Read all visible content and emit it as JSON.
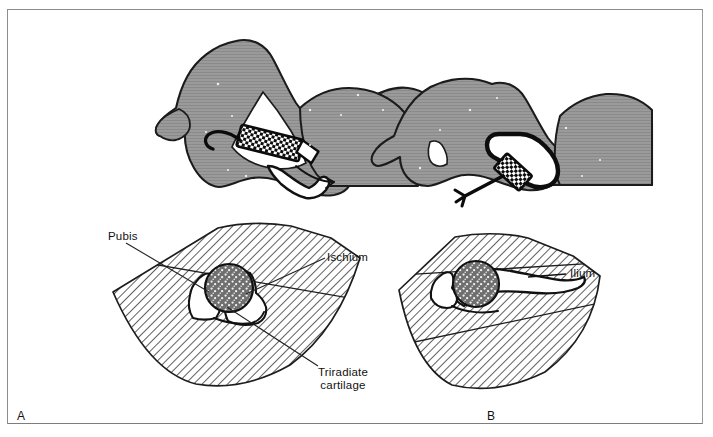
{
  "figure": {
    "panels": [
      {
        "id": "A",
        "letter": "A",
        "scan_plane": "coronal-anterior",
        "labels": [
          {
            "name": "pubis",
            "text": "Pubis"
          },
          {
            "name": "ischium",
            "text": "Ischium"
          },
          {
            "name": "triradiate-cartilage",
            "text": "Triradiate\ncartilage",
            "line1": "Triradiate",
            "line2": "cartilage"
          }
        ]
      },
      {
        "id": "B",
        "letter": "B",
        "scan_plane": "coronal-lateral",
        "labels": [
          {
            "name": "ilium",
            "text": "Ilium"
          }
        ]
      }
    ],
    "label_texts": {
      "pubis": "Pubis",
      "ischium": "Ischium",
      "triradiate_line1": "Triradiate",
      "triradiate_line2": "cartilage",
      "ilium": "Ilium",
      "panel_a": "A",
      "panel_b": "B"
    },
    "colors": {
      "background": "#ffffff",
      "frame": "#8d8d8d",
      "infant_fill": "#949494",
      "infant_outline": "#1a1a1a",
      "bone_fill": "#ffffff",
      "bone_outline": "#111111",
      "hatch_stroke": "#2b2b2b",
      "femoral_head_fill": "#6f6f6f",
      "stipple": "#ffffff",
      "transducer": "#0d0d0d",
      "label_text": "#111111",
      "leader_line": "#222222"
    },
    "anatomy": {
      "femoral_head": "stippled echogenic circle",
      "panel_a_structures": [
        "Pubis",
        "Ischium",
        "Triradiate cartilage"
      ],
      "panel_b_structures": [
        "Ilium"
      ]
    }
  }
}
